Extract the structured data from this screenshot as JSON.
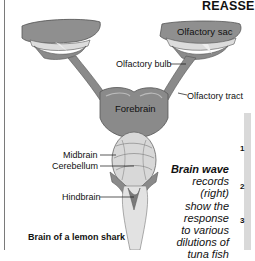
{
  "figure": {
    "heading": "REASSE",
    "caption": "Brain of a lemon shark",
    "labels": {
      "olfactory_sac": "Olfactory sac",
      "olfactory_bulb": "Olfactory bulb",
      "olfactory_tract": "Olfactory tract",
      "forebrain": "Forebrain",
      "midbrain": "Midbrain",
      "cerebellum": "Cerebellum",
      "hindbrain": "Hindbrain"
    },
    "sidebar_text": {
      "title": "Brain wave",
      "lines": [
        "records",
        "(right)",
        "show the",
        "response",
        "to various",
        "dilutions of",
        "tuna fish"
      ]
    },
    "row_numbers": [
      "1",
      "2",
      "3"
    ],
    "colors": {
      "brain_dark": "#8a8a8a",
      "brain_light": "#d8d8d8",
      "outline": "#555555",
      "panel": "#d9d9d9"
    }
  }
}
